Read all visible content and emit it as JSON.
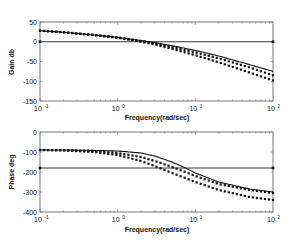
{
  "chart_data": [
    {
      "type": "line",
      "title": "",
      "xlabel": "Frequency(rad/sec)",
      "ylabel": "Gain db",
      "xscale": "log",
      "xlim": [
        0.1,
        100
      ],
      "ylim": [
        -150,
        50
      ],
      "xticks": [
        "10^-1",
        "10^0",
        "10^1",
        "10^2"
      ],
      "yticks": [
        50,
        0,
        -50,
        -100,
        -150
      ],
      "grid": false,
      "reference_line": {
        "y": 0,
        "style": "solid"
      },
      "series": [
        {
          "name": "solid",
          "style": "solid",
          "x": [
            0.1,
            0.2,
            0.5,
            1,
            2,
            3,
            5,
            10,
            20,
            50,
            100
          ],
          "y": [
            28,
            24,
            17,
            11,
            3,
            -2,
            -10,
            -22,
            -36,
            -58,
            -75
          ]
        },
        {
          "name": "dotted-1",
          "style": "dotted",
          "x": [
            0.1,
            0.2,
            0.5,
            1,
            2,
            3,
            5,
            10,
            20,
            50,
            100
          ],
          "y": [
            28,
            24,
            17,
            11,
            2,
            -4,
            -13,
            -27,
            -42,
            -65,
            -85
          ]
        },
        {
          "name": "dotted-2",
          "style": "dotted",
          "x": [
            0.1,
            0.2,
            0.5,
            1,
            2,
            3,
            5,
            10,
            20,
            50,
            100
          ],
          "y": [
            28,
            24,
            17,
            10,
            0,
            -7,
            -18,
            -34,
            -52,
            -78,
            -98
          ]
        }
      ]
    },
    {
      "type": "line",
      "title": "",
      "xlabel": "Frequency(rad/sec)",
      "ylabel": "Phase deg",
      "xscale": "log",
      "xlim": [
        0.1,
        100
      ],
      "ylim": [
        -400,
        0
      ],
      "xticks": [
        "10^-1",
        "10^0",
        "10^1",
        "10^2"
      ],
      "yticks": [
        0,
        -100,
        -200,
        -300,
        -400
      ],
      "grid": false,
      "reference_line": {
        "y": -180,
        "style": "solid"
      },
      "series": [
        {
          "name": "solid",
          "style": "solid",
          "x": [
            0.1,
            0.2,
            0.5,
            1,
            2,
            3,
            5,
            8,
            10,
            20,
            50,
            100
          ],
          "y": [
            -90,
            -90,
            -92,
            -95,
            -105,
            -120,
            -150,
            -185,
            -205,
            -250,
            -285,
            -300
          ]
        },
        {
          "name": "dotted-1",
          "style": "dotted",
          "x": [
            0.1,
            0.2,
            0.5,
            1,
            2,
            3,
            5,
            8,
            10,
            20,
            50,
            100
          ],
          "y": [
            -90,
            -91,
            -95,
            -105,
            -125,
            -145,
            -175,
            -205,
            -220,
            -260,
            -290,
            -305
          ]
        },
        {
          "name": "dotted-2",
          "style": "dotted",
          "x": [
            0.1,
            0.2,
            0.5,
            1,
            2,
            3,
            5,
            8,
            10,
            20,
            50,
            100
          ],
          "y": [
            -90,
            -92,
            -100,
            -115,
            -145,
            -170,
            -205,
            -235,
            -250,
            -290,
            -325,
            -340
          ]
        }
      ]
    }
  ],
  "plots": {
    "gain": {
      "ylabel": "Gain db",
      "xlabel": "Frequency(rad/sec)",
      "yticks": [
        "50",
        "0",
        "-50",
        "-100",
        "-150"
      ]
    },
    "phase": {
      "ylabel": "Phase deg",
      "xlabel": "Frequency(rad/sec)",
      "yticks": [
        "0",
        "-100",
        "-200",
        "-300",
        "-400"
      ]
    },
    "xticks": {
      "base": "10",
      "exponents": [
        "-1",
        "0",
        "1",
        "2"
      ]
    }
  }
}
